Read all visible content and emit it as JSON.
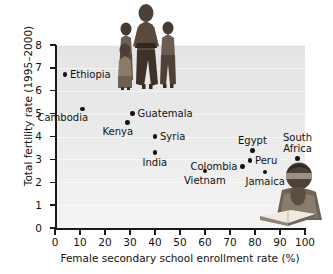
{
  "chart_data": {
    "type": "scatter",
    "title": "",
    "xlabel": "Female secondary school enrollment rate (%)",
    "ylabel": "Total fertility rate (1995–2000)",
    "xlim": [
      0,
      100
    ],
    "ylim": [
      0,
      8
    ],
    "xticks": [
      0,
      10,
      20,
      30,
      40,
      50,
      60,
      70,
      80,
      90,
      100
    ],
    "yticks": [
      0,
      1,
      2,
      3,
      4,
      5,
      6,
      7,
      8
    ],
    "grid": "horizontal-light",
    "legend": "none",
    "points": [
      {
        "label": "Ethiopia",
        "x": 4,
        "y": 6.7,
        "label_pos": "right"
      },
      {
        "label": "Cambodia",
        "x": 11,
        "y": 5.2,
        "label_pos": "below-left"
      },
      {
        "label": "Guatemala",
        "x": 31,
        "y": 5.0,
        "label_pos": "right"
      },
      {
        "label": "Kenya",
        "x": 29,
        "y": 4.6,
        "label_pos": "below-left"
      },
      {
        "label": "Syria",
        "x": 40,
        "y": 4.0,
        "label_pos": "right"
      },
      {
        "label": "India",
        "x": 40,
        "y": 3.3,
        "label_pos": "below"
      },
      {
        "label": "Egypt",
        "x": 79,
        "y": 3.4,
        "label_pos": "above"
      },
      {
        "label": "South Africa",
        "x": 97,
        "y": 3.05,
        "label_pos": "above"
      },
      {
        "label": "Peru",
        "x": 78,
        "y": 2.95,
        "label_pos": "right"
      },
      {
        "label": "Colombia",
        "x": 75,
        "y": 2.7,
        "label_pos": "left"
      },
      {
        "label": "Vietnam",
        "x": 60,
        "y": 2.5,
        "label_pos": "below"
      },
      {
        "label": "Jamaica",
        "x": 84,
        "y": 2.45,
        "label_pos": "below"
      }
    ]
  },
  "axes": {
    "x_title": "Female secondary school enrollment rate (%)",
    "y_title": "Total fertility rate (1995–2000)",
    "x_tick_labels": [
      "0",
      "10",
      "20",
      "30",
      "40",
      "50",
      "60",
      "70",
      "80",
      "90",
      "100"
    ],
    "y_tick_labels": [
      "0",
      "1",
      "2",
      "3",
      "4",
      "5",
      "6",
      "7",
      "8"
    ]
  },
  "photos": [
    {
      "name": "family-photo",
      "caption": ""
    },
    {
      "name": "girl-reading-photo",
      "caption": ""
    }
  ],
  "colors": {
    "marker": "#121212",
    "plot_background": "#e9e9e9",
    "axis": "#1a1a1a",
    "text": "#111111"
  }
}
